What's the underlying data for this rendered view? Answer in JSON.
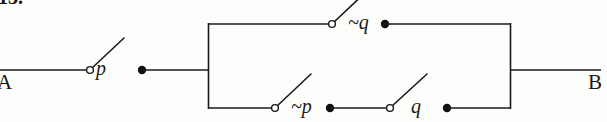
{
  "figure": {
    "kind": "switching-circuit-diagram",
    "caption_fragment": "13.",
    "ink_color": "#1a1a1a",
    "paper_color": "#fdfdfb",
    "width": 607,
    "height": 122
  },
  "terminals": {
    "left": {
      "label": "A",
      "x": 0,
      "y": 70
    },
    "right": {
      "label": "B",
      "x": 600,
      "y": 70
    }
  },
  "switches": [
    {
      "id": "switch-p",
      "label": "p",
      "state": "open",
      "branch": "series-input",
      "pivot": {
        "x": 90,
        "y": 70
      },
      "blade_tip": {
        "x": 124,
        "y": 38
      },
      "contact_dot": {
        "x": 142,
        "y": 70
      }
    },
    {
      "id": "switch-not-q",
      "label": "~q",
      "state": "open",
      "branch": "parallel-top",
      "pivot": {
        "x": 332,
        "y": 24
      },
      "blade_tip": {
        "x": 366,
        "y": -8
      },
      "contact_dot": {
        "x": 385,
        "y": 24
      }
    },
    {
      "id": "switch-not-p",
      "label": "~p",
      "state": "open",
      "branch": "parallel-bottom",
      "pivot": {
        "x": 275,
        "y": 108
      },
      "blade_tip": {
        "x": 310,
        "y": 76
      },
      "contact_dot": {
        "x": 330,
        "y": 108
      }
    },
    {
      "id": "switch-q",
      "label": "q",
      "state": "open",
      "branch": "parallel-bottom",
      "pivot": {
        "x": 390,
        "y": 108
      },
      "blade_tip": {
        "x": 425,
        "y": 76
      },
      "contact_dot": {
        "x": 447,
        "y": 108
      }
    }
  ],
  "wires": {
    "input_lead": {
      "from_x": 0,
      "to_x": 90,
      "y": 70
    },
    "p_to_node": {
      "from_x": 142,
      "to_x": 208,
      "y": 70
    },
    "parallel_left_rail": {
      "x": 208,
      "from_y": 24,
      "to_y": 108
    },
    "parallel_right_rail": {
      "x": 510,
      "from_y": 24,
      "to_y": 108
    },
    "top_branch_left": {
      "from_x": 208,
      "to_x": 332,
      "y": 24
    },
    "top_branch_right": {
      "from_x": 385,
      "to_x": 510,
      "y": 24
    },
    "bottom_branch_left": {
      "from_x": 208,
      "to_x": 275,
      "y": 108
    },
    "bottom_branch_mid": {
      "from_x": 330,
      "to_x": 390,
      "y": 108
    },
    "bottom_branch_right": {
      "from_x": 447,
      "to_x": 510,
      "y": 108
    },
    "output_lead": {
      "from_x": 510,
      "to_x": 600,
      "y": 70
    }
  }
}
